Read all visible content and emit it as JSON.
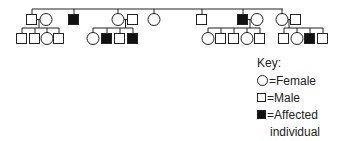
{
  "diagram": {
    "type": "pedigree",
    "stroke_color": "#222222",
    "fill_affected": "#111111",
    "sibship_line": {
      "y": 9,
      "x1": 32,
      "x2": 283
    },
    "generation2": [
      {
        "id": "II-1",
        "sex": "male",
        "affected": false,
        "x": 26,
        "y": 14
      },
      {
        "id": "II-2",
        "sex": "female",
        "affected": false,
        "x": 40,
        "y": 14,
        "spouse_of": "II-1",
        "married_in": true
      },
      {
        "id": "II-3",
        "sex": "male",
        "affected": true,
        "x": 68,
        "y": 14
      },
      {
        "id": "II-4",
        "sex": "female",
        "affected": false,
        "x": 112,
        "y": 14
      },
      {
        "id": "II-5",
        "sex": "male",
        "affected": false,
        "x": 127,
        "y": 14,
        "spouse_of": "II-4",
        "married_in": true
      },
      {
        "id": "II-6",
        "sex": "female",
        "affected": false,
        "x": 148,
        "y": 14
      },
      {
        "id": "II-7",
        "sex": "male",
        "affected": false,
        "x": 196,
        "y": 14
      },
      {
        "id": "II-8",
        "sex": "male",
        "affected": true,
        "x": 237,
        "y": 14
      },
      {
        "id": "II-9",
        "sex": "female",
        "affected": false,
        "x": 251,
        "y": 14,
        "spouse_of": "II-8",
        "married_in": true
      },
      {
        "id": "II-10",
        "sex": "female",
        "affected": false,
        "x": 276,
        "y": 14
      },
      {
        "id": "II-11",
        "sex": "male",
        "affected": false,
        "x": 290,
        "y": 14,
        "spouse_of": "II-10",
        "married_in": true
      }
    ],
    "generation3": [
      {
        "parents": [
          "II-1",
          "II-2"
        ],
        "children": [
          {
            "sex": "male",
            "affected": false,
            "x": 16
          },
          {
            "sex": "male",
            "affected": false,
            "x": 29
          },
          {
            "sex": "female",
            "affected": false,
            "x": 41
          },
          {
            "sex": "male",
            "affected": false,
            "x": 53
          }
        ]
      },
      {
        "parents": [
          "II-4",
          "II-5"
        ],
        "children": [
          {
            "sex": "female",
            "affected": false,
            "x": 87
          },
          {
            "sex": "male",
            "affected": true,
            "x": 101
          },
          {
            "sex": "male",
            "affected": false,
            "x": 114
          },
          {
            "sex": "male",
            "affected": true,
            "x": 127
          }
        ]
      },
      {
        "parents": [
          "II-8",
          "II-9"
        ],
        "children": [
          {
            "sex": "female",
            "affected": false,
            "x": 202
          },
          {
            "sex": "male",
            "affected": false,
            "x": 215
          },
          {
            "sex": "male",
            "affected": false,
            "x": 228
          },
          {
            "sex": "female",
            "affected": false,
            "x": 241
          },
          {
            "sex": "male",
            "affected": false,
            "x": 254
          }
        ]
      },
      {
        "parents": [
          "II-10",
          "II-11"
        ],
        "children": [
          {
            "sex": "male",
            "affected": false,
            "x": 278
          },
          {
            "sex": "female",
            "affected": false,
            "x": 291
          },
          {
            "sex": "male",
            "affected": true,
            "x": 304
          },
          {
            "sex": "male",
            "affected": false,
            "x": 317
          }
        ]
      }
    ]
  },
  "key": {
    "title": "Key:",
    "female_label": "=Female",
    "male_label": "=Male",
    "affected_label_line1": "=Affected",
    "affected_label_line2": "individual"
  }
}
